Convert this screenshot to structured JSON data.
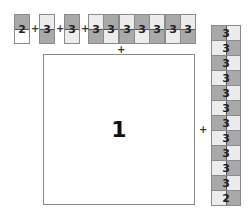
{
  "colors": {
    "dark": "#a9a9a9",
    "light": "#ececec",
    "white": "#ffffff"
  },
  "top_row": {
    "singles": [
      {
        "label": "2",
        "top": "dark",
        "bottom": "white"
      },
      {
        "label": "3",
        "top": "light",
        "bottom": "dark"
      },
      {
        "label": "3",
        "top": "dark",
        "bottom": "light"
      }
    ],
    "group": [
      {
        "label": "3",
        "top": "light",
        "bottom": "dark"
      },
      {
        "label": "3",
        "top": "dark",
        "bottom": "light"
      },
      {
        "label": "3",
        "top": "light",
        "bottom": "dark"
      },
      {
        "label": "3",
        "top": "dark",
        "bottom": "light"
      },
      {
        "label": "3",
        "top": "light",
        "bottom": "dark"
      },
      {
        "label": "3",
        "top": "dark",
        "bottom": "light"
      },
      {
        "label": "3",
        "top": "light",
        "bottom": "dark"
      }
    ]
  },
  "column": [
    {
      "label": "3",
      "left": "dark",
      "right": "light"
    },
    {
      "label": "3",
      "left": "light",
      "right": "dark"
    },
    {
      "label": "3",
      "left": "dark",
      "right": "light"
    },
    {
      "label": "3",
      "left": "light",
      "right": "dark"
    },
    {
      "label": "3",
      "left": "dark",
      "right": "light"
    },
    {
      "label": "3",
      "left": "light",
      "right": "dark"
    },
    {
      "label": "3",
      "left": "dark",
      "right": "light"
    },
    {
      "label": "3",
      "left": "light",
      "right": "dark"
    },
    {
      "label": "3",
      "left": "dark",
      "right": "light"
    },
    {
      "label": "3",
      "left": "light",
      "right": "dark"
    },
    {
      "label": "3",
      "left": "dark",
      "right": "light"
    },
    {
      "label": "2",
      "left": "light",
      "right": "dark"
    }
  ],
  "big_square": {
    "label": "1"
  },
  "plus_sign": "+"
}
